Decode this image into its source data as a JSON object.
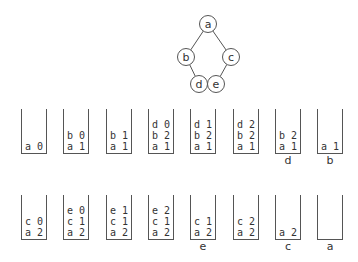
{
  "tree": {
    "nodes": [
      {
        "id": "a",
        "label": "a",
        "x": 208,
        "y": 24
      },
      {
        "id": "b",
        "label": "b",
        "x": 186,
        "y": 57
      },
      {
        "id": "c",
        "label": "c",
        "x": 231,
        "y": 57
      },
      {
        "id": "d",
        "label": "d",
        "x": 199,
        "y": 84
      },
      {
        "id": "e",
        "label": "e",
        "x": 216,
        "y": 84
      }
    ],
    "edges": [
      [
        "a",
        "b"
      ],
      [
        "a",
        "c"
      ],
      [
        "b",
        "d"
      ],
      [
        "c",
        "e"
      ]
    ]
  },
  "rows": [
    {
      "top": 109,
      "stacks": [
        {
          "frames": [
            "a 0"
          ],
          "caption": ""
        },
        {
          "frames": [
            "b 0",
            "a 1"
          ],
          "caption": ""
        },
        {
          "frames": [
            "b 1",
            "a 1"
          ],
          "caption": ""
        },
        {
          "frames": [
            "d 0",
            "b 2",
            "a 1"
          ],
          "caption": ""
        },
        {
          "frames": [
            "d 1",
            "b 2",
            "a 1"
          ],
          "caption": ""
        },
        {
          "frames": [
            "d 2",
            "b 2",
            "a 1"
          ],
          "caption": ""
        },
        {
          "frames": [
            "b 2",
            "a 1"
          ],
          "caption": "d"
        },
        {
          "frames": [
            "a 1"
          ],
          "caption": "b"
        }
      ]
    },
    {
      "top": 195,
      "stacks": [
        {
          "frames": [
            "c 0",
            "a 2"
          ],
          "caption": ""
        },
        {
          "frames": [
            "e 0",
            "c 1",
            "a 2"
          ],
          "caption": ""
        },
        {
          "frames": [
            "e 1",
            "c 1",
            "a 2"
          ],
          "caption": ""
        },
        {
          "frames": [
            "e 2",
            "c 1",
            "a 2"
          ],
          "caption": ""
        },
        {
          "frames": [
            "c 1",
            "a 2"
          ],
          "caption": "e"
        },
        {
          "frames": [
            "c 2",
            "a 2"
          ],
          "caption": ""
        },
        {
          "frames": [
            "a 2"
          ],
          "caption": "c"
        },
        {
          "frames": [],
          "caption": "a"
        }
      ]
    }
  ]
}
